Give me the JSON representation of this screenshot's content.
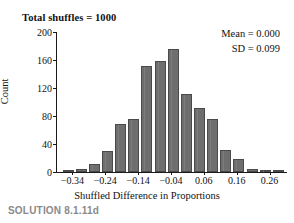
{
  "chart_data": {
    "type": "bar",
    "title": "Total shuffles = 1000",
    "xlabel": "Shuffled Difference in Proportions",
    "ylabel": "Count",
    "grid": false,
    "legend": null,
    "xlim": [
      -0.39,
      0.31
    ],
    "ylim": [
      0,
      200
    ],
    "bin_width": 0.04,
    "x_tick_labels": [
      "−0.34",
      "−0.24",
      "−0.14",
      "−0.04",
      "0.06",
      "0.16",
      "0.26"
    ],
    "x_tick_values": [
      -0.34,
      -0.24,
      -0.14,
      -0.04,
      0.06,
      0.16,
      0.26
    ],
    "y_tick_labels": [
      "0",
      "40",
      "80",
      "120",
      "160",
      "200"
    ],
    "y_tick_values": [
      0,
      40,
      80,
      120,
      160,
      200
    ],
    "bin_centers": [
      -0.35,
      -0.31,
      -0.27,
      -0.23,
      -0.19,
      -0.15,
      -0.11,
      -0.07,
      -0.03,
      0.01,
      0.05,
      0.09,
      0.13,
      0.17,
      0.21,
      0.25,
      0.29
    ],
    "values": [
      2,
      5,
      11,
      30,
      68,
      76,
      152,
      159,
      176,
      112,
      92,
      76,
      31,
      18,
      5,
      3,
      2
    ],
    "annotations": [
      "Mean = 0.000",
      "SD = 0.099"
    ],
    "bar_color": "#6e6e6e",
    "bar_edge_color": "#4a4a4a",
    "axis_color": "#1a1a1a"
  },
  "caption": {
    "text": "SOLUTION 8.1.11d",
    "color": "#8a8a8a"
  }
}
